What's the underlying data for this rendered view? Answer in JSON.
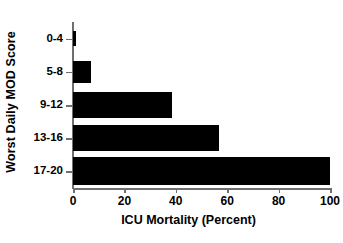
{
  "chart_data": {
    "type": "bar",
    "orientation": "horizontal",
    "title": "",
    "xlabel": "ICU Mortality (Percent)",
    "ylabel": "Worst Daily MOD Score",
    "categories": [
      "0-4",
      "5-8",
      "9-12",
      "13-16",
      "17-20"
    ],
    "values": [
      1,
      7,
      38.5,
      57,
      100
    ],
    "xlim": [
      0,
      100
    ],
    "xticks": [
      0,
      20,
      40,
      60,
      80,
      100
    ],
    "xtick_labels": [
      "0",
      "20",
      "40",
      "60",
      "80",
      "100"
    ],
    "grid": false,
    "legend": null,
    "series": [
      {
        "name": "ICU Mortality",
        "color": "#000000",
        "values": [
          1,
          7,
          38.5,
          57,
          100
        ]
      }
    ],
    "bar_color": "#000000",
    "axis_color": "#6f6f6f",
    "background": "#ffffff"
  }
}
